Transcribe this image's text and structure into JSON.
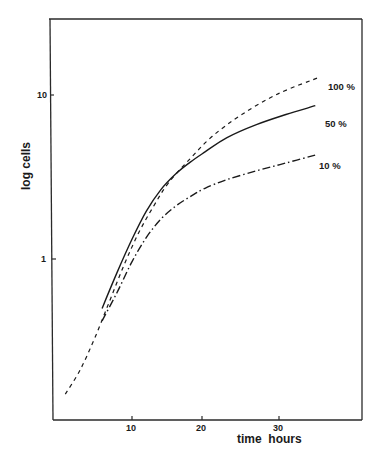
{
  "chart_data": {
    "type": "line",
    "title": "",
    "xlabel": "time  hours",
    "ylabel": "log cells",
    "yscale": "log",
    "x_ticks": [
      10,
      20,
      30
    ],
    "y_ticks": [
      1,
      10
    ],
    "x_tick_labels": [
      "10",
      "20",
      "30"
    ],
    "y_tick_labels": [
      "1",
      "10"
    ],
    "xlim": [
      -1,
      41
    ],
    "ylim": [
      0.1,
      30
    ],
    "grid": false,
    "legend": "inline labels at line ends",
    "series": [
      {
        "name": "100 %",
        "style": "dashed",
        "x": [
          1,
          3,
          5,
          7,
          9,
          11,
          13,
          15,
          18,
          21,
          25,
          30,
          35.5
        ],
        "y": [
          0.15,
          0.21,
          0.33,
          0.55,
          0.92,
          1.45,
          2.1,
          2.9,
          4.1,
          5.6,
          7.6,
          10.2,
          12.8
        ]
      },
      {
        "name": "50 %",
        "style": "solid",
        "x": [
          6,
          8,
          10,
          12,
          14,
          16,
          18,
          20,
          23,
          27,
          31,
          35
        ],
        "y": [
          0.5,
          0.82,
          1.3,
          1.95,
          2.65,
          3.3,
          3.9,
          4.5,
          5.5,
          6.6,
          7.6,
          8.6
        ]
      },
      {
        "name": "10 %",
        "style": "dash-dot",
        "x": [
          6,
          8,
          10,
          12,
          14,
          16,
          18,
          20,
          23,
          27,
          31,
          35
        ],
        "y": [
          0.42,
          0.62,
          0.95,
          1.35,
          1.75,
          2.1,
          2.4,
          2.7,
          3.05,
          3.45,
          3.85,
          4.3
        ]
      }
    ]
  },
  "axes": {
    "y_tick_labels": [
      "10",
      "1"
    ],
    "x_tick_labels": [
      "10",
      "20",
      "30"
    ],
    "xlabel": "time  hours",
    "ylabel": "log cells"
  },
  "labels": {
    "s100": "100 %",
    "s50": "50 %",
    "s10": "10 %"
  }
}
